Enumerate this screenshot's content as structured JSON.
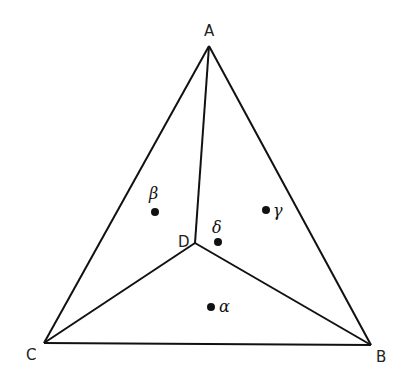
{
  "diagram": {
    "type": "triangle-subdivision",
    "vertices": [
      {
        "id": "A",
        "label": "A",
        "x": 209,
        "y": 46,
        "label_x": 204,
        "label_y": 36
      },
      {
        "id": "B",
        "label": "B",
        "x": 371,
        "y": 345,
        "label_x": 376,
        "label_y": 362
      },
      {
        "id": "C",
        "label": "C",
        "x": 44,
        "y": 343,
        "label_x": 26,
        "label_y": 360
      },
      {
        "id": "D",
        "label": "D",
        "x": 195,
        "y": 243,
        "label_x": 178,
        "label_y": 247
      }
    ],
    "edges": [
      {
        "from": "A",
        "to": "B"
      },
      {
        "from": "B",
        "to": "C"
      },
      {
        "from": "C",
        "to": "A"
      },
      {
        "from": "A",
        "to": "D"
      },
      {
        "from": "B",
        "to": "D"
      },
      {
        "from": "C",
        "to": "D"
      }
    ],
    "points": [
      {
        "id": "beta",
        "label": "β",
        "x": 155,
        "y": 212,
        "label_x": 149,
        "label_y": 199
      },
      {
        "id": "gamma",
        "label": "γ",
        "x": 266,
        "y": 210,
        "label_x": 273,
        "label_y": 216
      },
      {
        "id": "delta",
        "label": "δ",
        "x": 218,
        "y": 242,
        "label_x": 212,
        "label_y": 233
      },
      {
        "id": "alpha",
        "label": "α",
        "x": 211,
        "y": 307,
        "label_x": 219,
        "label_y": 312
      }
    ]
  }
}
